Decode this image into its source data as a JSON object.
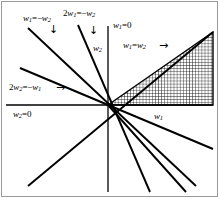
{
  "figure": {
    "kind": "math-line-diagram",
    "background_color": "#ffffff",
    "ink_color": "#000000",
    "border_color": "#808080",
    "origin": {
      "x": 108,
      "y": 105
    },
    "axes": {
      "horizontal_label": "w1",
      "vertical_label": "w2",
      "horizontal_axis_equation": "w2=0",
      "vertical_axis_equation": "w1=0"
    },
    "labels": [
      {
        "id": "line-w1-eq-neg-w2",
        "text": "w1=-w2",
        "lead": "w",
        "sub1": "1",
        "op": "=−",
        "lead2": "w",
        "sub2": "2",
        "coef": "",
        "arrow": "↓"
      },
      {
        "id": "line-2w1-eq-neg-w2",
        "text": "2w1=-w2",
        "lead": "w",
        "sub1": "1",
        "op": "=−",
        "lead2": "w",
        "sub2": "2",
        "coef": "2",
        "arrow": "↓"
      },
      {
        "id": "line-2w2-eq-neg-w1",
        "text": "2w2=-w1",
        "lead": "w",
        "sub1": "2",
        "op": "=−",
        "lead2": "w",
        "sub2": "1",
        "coef": "2",
        "arrow": "→"
      },
      {
        "id": "line-w1-eq-w2",
        "text": "w1=w2",
        "lead": "w",
        "sub1": "1",
        "op": "=",
        "lead2": "w",
        "sub2": "2",
        "coef": "",
        "arrow": "→"
      },
      {
        "id": "axis-w1-eq-0",
        "text": "w1=0",
        "lead": "w",
        "sub1": "1",
        "op": "=",
        "lead2": "0",
        "sub2": "",
        "coef": "",
        "arrow": ""
      },
      {
        "id": "axis-w2-eq-0",
        "text": "w2=0",
        "lead": "w",
        "sub1": "2",
        "op": "=",
        "lead2": "0",
        "sub2": "",
        "coef": "",
        "arrow": ""
      }
    ],
    "shaded_region": {
      "id": "cone-w1-gt-w2-gt-0",
      "fill": "crosshatch-grid",
      "description": "triangular region between the w1 axis and the line w1=w2"
    },
    "text": {
      "w": "w",
      "sub_1": "1",
      "sub_2": "2",
      "zero": "0",
      "two": "2",
      "eq": "=",
      "eq_neg": "=−",
      "arrow_down": "↓",
      "arrow_right": "→"
    }
  }
}
